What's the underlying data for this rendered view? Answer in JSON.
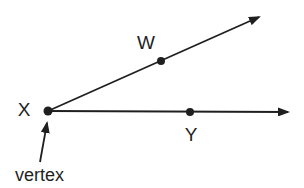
{
  "figure": {
    "width": 304,
    "height": 188,
    "background_color": "#ffffff",
    "ink_color": "#1f1f1f",
    "vertex_point": {
      "label": "X",
      "x": 48,
      "y": 111,
      "dot_radius": 4.5,
      "label_x": 24,
      "label_y": 116,
      "label_font_size": 19
    },
    "rays": [
      {
        "name": "ray-through-w",
        "x2": 259,
        "y2": 17
      },
      {
        "name": "ray-through-y",
        "x2": 288,
        "y2": 112
      }
    ],
    "points": [
      {
        "label": "W",
        "x": 161,
        "y": 61,
        "dot_radius": 4,
        "label_x": 146,
        "label_y": 49,
        "label_font_size": 19
      },
      {
        "label": "Y",
        "x": 190,
        "y": 112,
        "dot_radius": 4,
        "label_x": 191,
        "label_y": 141,
        "label_font_size": 19
      }
    ],
    "annotation": {
      "label": "vertex",
      "label_x": 15,
      "label_y": 181,
      "label_font_size": 18,
      "arrow": {
        "x1": 40,
        "y1": 162,
        "x2": 47,
        "y2": 123
      }
    },
    "line_width": 1.8
  }
}
